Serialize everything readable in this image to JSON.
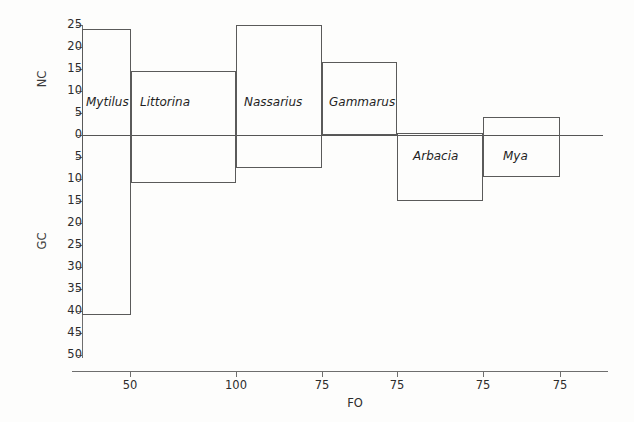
{
  "chart_data": {
    "type": "bar",
    "title": "",
    "xlabel": "FO",
    "ylabel_upper": "NC",
    "ylabel_lower": "GC",
    "grid": false,
    "legend": "none",
    "x_tick_labels": [
      "50",
      "100",
      "75",
      "75",
      "75",
      "75"
    ],
    "y_tick_labels": [
      "25",
      "20",
      "15",
      "10",
      "5",
      "0",
      "5",
      "10",
      "15",
      "20",
      "25",
      "30",
      "35",
      "40",
      "45",
      "50"
    ],
    "y_upper_range": [
      0,
      25
    ],
    "y_lower_range": [
      0,
      50
    ],
    "note": "Each species is drawn as a rectangle spanning an NC value above the zero line and a GC value below it.",
    "categories": [
      "Mytilus",
      "Littorina",
      "Nassarius",
      "Gammarus",
      "Arbacia",
      "Mya"
    ],
    "series": [
      {
        "name": "NC",
        "values": [
          24,
          14.5,
          25,
          16.5,
          0.5,
          4
        ]
      },
      {
        "name": "GC",
        "values": [
          41,
          11,
          7.5,
          0,
          15,
          9.5
        ]
      }
    ],
    "boxes": [
      {
        "label": "Mytilus",
        "x_left": 82,
        "x_right": 131,
        "nc": 24,
        "gc": 41,
        "label_x": 86,
        "label_y": 96
      },
      {
        "label": "Littorina",
        "x_left": 131,
        "x_right": 236,
        "nc": 14.5,
        "gc": 11,
        "label_x": 140,
        "label_y": 96
      },
      {
        "label": "Nassarius",
        "x_left": 236,
        "x_right": 322,
        "nc": 25,
        "gc": 7.5,
        "label_x": 244,
        "label_y": 96
      },
      {
        "label": "Gammarus",
        "x_left": 322,
        "x_right": 397,
        "nc": 16.5,
        "gc": 0,
        "label_x": 329,
        "label_y": 96
      },
      {
        "label": "Arbacia",
        "x_left": 397,
        "x_right": 483,
        "nc": 0.5,
        "gc": 15,
        "label_x": 413,
        "label_y": 150
      },
      {
        "label": "Mya",
        "x_left": 483,
        "x_right": 560,
        "nc": 4,
        "gc": 9.5,
        "label_x": 503,
        "label_y": 150
      }
    ],
    "x_tick_positions": [
      130,
      236,
      322,
      397,
      483,
      560
    ],
    "colors": {
      "background": "#fdfdfc",
      "axis": "#6e6e6e",
      "box_stroke": "#5a5a5a",
      "text": "#2c2c2c"
    }
  }
}
